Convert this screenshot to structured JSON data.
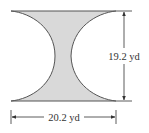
{
  "figure": {
    "type": "geometric-diagram",
    "colors": {
      "fill": "#d9d9d9",
      "stroke": "#555555",
      "dimension_line": "#333333",
      "background": "#ffffff"
    },
    "height_dimension": {
      "label": "19.2 yd",
      "value": 19.2,
      "unit": "yd"
    },
    "width_dimension": {
      "label": "20.2 yd",
      "value": 20.2,
      "unit": "yd"
    }
  }
}
